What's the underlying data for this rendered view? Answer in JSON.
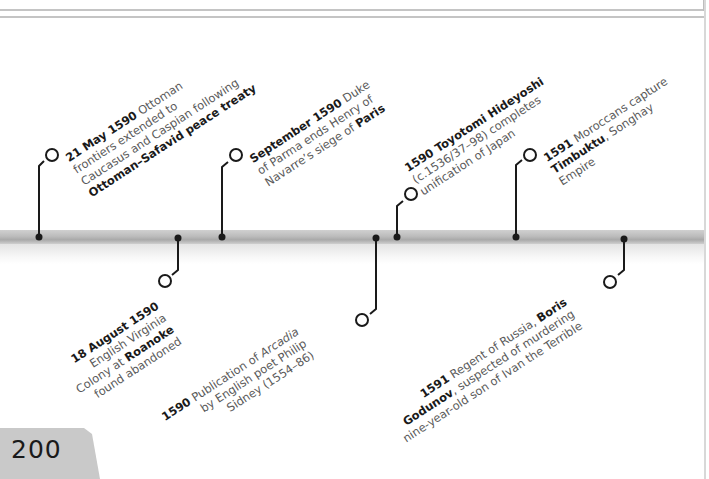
{
  "page": {
    "number": "200"
  },
  "colors": {
    "text": "#5a5a5a",
    "bold_text": "#1a1a1a",
    "band": "#bcbcbc",
    "connector": "#1a1a1a",
    "page_tab": "#c9c9c9"
  },
  "timeline": {
    "events": [
      {
        "id": "ottoman-safavid",
        "position": "above",
        "lines": [
          [
            {
              "b": "21 May 1590"
            },
            {
              "t": " Ottoman"
            }
          ],
          [
            {
              "t": "frontiers extended to"
            }
          ],
          [
            {
              "t": "Caucasus and Caspian following"
            }
          ],
          [
            {
              "b": "Ottoman–Safavid peace treaty"
            }
          ]
        ]
      },
      {
        "id": "roanoke",
        "position": "below",
        "lines": [
          [
            {
              "b": "18 August 1590"
            }
          ],
          [
            {
              "t": "English Virginia"
            }
          ],
          [
            {
              "t": "Colony at "
            },
            {
              "b": "Roanoke"
            }
          ],
          [
            {
              "t": "found abandoned"
            }
          ]
        ]
      },
      {
        "id": "siege-of-paris",
        "position": "above",
        "lines": [
          [
            {
              "b": "September 1590"
            },
            {
              "t": " Duke"
            }
          ],
          [
            {
              "t": "of Parma ends Henry of"
            }
          ],
          [
            {
              "t": "Navarre’s siege of "
            },
            {
              "b": "Paris"
            }
          ]
        ]
      },
      {
        "id": "arcadia",
        "position": "below",
        "lines": [
          [
            {
              "b": "1590"
            },
            {
              "t": " Publication of "
            },
            {
              "i": "Arcadia"
            }
          ],
          [
            {
              "t": "by English poet Philip"
            }
          ],
          [
            {
              "t": "Sidney (1554–86)"
            }
          ]
        ]
      },
      {
        "id": "hideyoshi",
        "position": "above",
        "lines": [
          [
            {
              "b": "1590 Toyotomi Hideyoshi"
            }
          ],
          [
            {
              "t": "(c.1536/37–98) completes"
            }
          ],
          [
            {
              "t": "unification of Japan"
            }
          ]
        ]
      },
      {
        "id": "timbuktu",
        "position": "above",
        "lines": [
          [
            {
              "b": "1591"
            },
            {
              "t": " Moroccans capture"
            }
          ],
          [
            {
              "b": "Timbuktu"
            },
            {
              "t": ", Songhay"
            }
          ],
          [
            {
              "t": "Empire"
            }
          ]
        ]
      },
      {
        "id": "godunov",
        "position": "below",
        "lines": [
          [
            {
              "b": "1591"
            },
            {
              "t": " Regent of Russia, "
            },
            {
              "b": "Boris"
            }
          ],
          [
            {
              "b": "Godunov"
            },
            {
              "t": ", suspected of murdering"
            }
          ],
          [
            {
              "t": "nine-year-old son of Ivan the Terrible"
            }
          ]
        ]
      }
    ]
  }
}
